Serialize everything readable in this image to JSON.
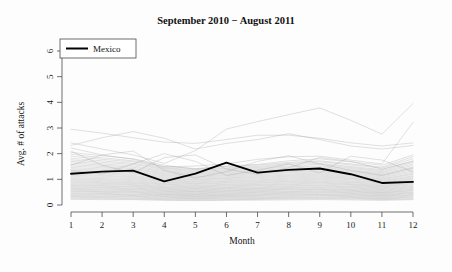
{
  "chart_data": {
    "type": "line",
    "title": "September 2010 − August 2011",
    "xlabel": "Month",
    "ylabel": "Avg. # of attacks",
    "x": [
      1,
      2,
      3,
      4,
      5,
      6,
      7,
      8,
      9,
      10,
      11,
      12
    ],
    "xtick_labels": [
      "1",
      "2",
      "3",
      "4",
      "5",
      "6",
      "7",
      "8",
      "9",
      "10",
      "11",
      "12"
    ],
    "ytick_labels": [
      "0",
      "1",
      "2",
      "3",
      "4",
      "5",
      "6"
    ],
    "yticks": [
      0,
      1,
      2,
      3,
      4,
      5,
      6
    ],
    "xlim": [
      1,
      12
    ],
    "ylim": [
      0,
      6
    ],
    "grid": false,
    "legend_position": "top-left",
    "legend": [
      {
        "name": "Mexico",
        "color": "#000000",
        "style": "solid-bold"
      }
    ],
    "highlight_series": {
      "name": "Mexico",
      "color": "#000000",
      "values": [
        1.22,
        1.3,
        1.34,
        0.92,
        1.22,
        1.65,
        1.26,
        1.37,
        1.42,
        1.2,
        0.86,
        0.9
      ]
    },
    "background_series_color": "#9a9a9a",
    "background_series_count": 48,
    "series": [
      {
        "name": "bg-01",
        "values": [
          2.95,
          2.8,
          2.62,
          2.45,
          2.4,
          2.55,
          2.72,
          2.72,
          2.6,
          2.42,
          2.3,
          2.42
        ]
      },
      {
        "name": "bg-02",
        "values": [
          2.32,
          2.62,
          2.86,
          2.6,
          2.18,
          2.4,
          2.55,
          2.78,
          2.55,
          2.3,
          2.18,
          2.32
        ]
      },
      {
        "name": "bg-03",
        "values": [
          2.42,
          2.18,
          1.95,
          1.62,
          2.12,
          2.96,
          3.25,
          3.52,
          3.78,
          3.3,
          2.76,
          3.95
        ]
      },
      {
        "name": "bg-04",
        "values": [
          2.22,
          1.95,
          1.78,
          1.48,
          1.52,
          1.6,
          1.78,
          1.88,
          1.9,
          1.75,
          1.6,
          3.22
        ]
      },
      {
        "name": "bg-05",
        "values": [
          2.05,
          1.92,
          1.8,
          1.55,
          1.4,
          1.52,
          1.58,
          1.72,
          1.8,
          1.68,
          1.55,
          1.95
        ]
      },
      {
        "name": "bg-06",
        "values": [
          1.98,
          1.84,
          1.72,
          1.5,
          1.42,
          1.5,
          1.55,
          1.66,
          1.72,
          1.6,
          1.48,
          1.88
        ]
      },
      {
        "name": "bg-07",
        "values": [
          1.9,
          1.78,
          1.68,
          1.45,
          1.38,
          1.45,
          1.5,
          1.62,
          1.68,
          1.56,
          1.44,
          1.8
        ]
      },
      {
        "name": "bg-08",
        "values": [
          1.82,
          1.72,
          1.62,
          1.42,
          1.34,
          1.42,
          1.46,
          1.58,
          1.62,
          1.5,
          1.38,
          1.72
        ]
      },
      {
        "name": "bg-09",
        "values": [
          1.76,
          1.66,
          1.58,
          1.38,
          1.3,
          1.38,
          1.42,
          1.52,
          1.58,
          1.46,
          1.34,
          1.66
        ]
      },
      {
        "name": "bg-10",
        "values": [
          1.7,
          1.6,
          1.52,
          1.34,
          1.26,
          1.34,
          1.38,
          1.48,
          1.52,
          1.42,
          1.3,
          1.6
        ]
      },
      {
        "name": "bg-11",
        "values": [
          1.64,
          1.55,
          1.47,
          1.3,
          1.22,
          1.3,
          1.34,
          1.43,
          1.47,
          1.37,
          1.26,
          1.54
        ]
      },
      {
        "name": "bg-12",
        "values": [
          1.58,
          1.5,
          1.42,
          1.26,
          1.19,
          1.26,
          1.3,
          1.39,
          1.42,
          1.33,
          1.22,
          1.48
        ]
      },
      {
        "name": "bg-13",
        "values": [
          1.52,
          1.45,
          1.38,
          1.22,
          1.15,
          1.22,
          1.26,
          1.34,
          1.38,
          1.29,
          1.18,
          1.43
        ]
      },
      {
        "name": "bg-14",
        "values": [
          1.46,
          1.4,
          1.33,
          1.18,
          1.11,
          1.18,
          1.22,
          1.3,
          1.33,
          1.25,
          1.14,
          1.38
        ]
      },
      {
        "name": "bg-15",
        "values": [
          1.41,
          1.35,
          1.29,
          1.14,
          1.08,
          1.14,
          1.18,
          1.26,
          1.29,
          1.21,
          1.1,
          1.33
        ]
      },
      {
        "name": "bg-16",
        "values": [
          1.36,
          1.3,
          1.24,
          1.1,
          1.04,
          1.1,
          1.14,
          1.21,
          1.25,
          1.17,
          1.06,
          1.28
        ]
      },
      {
        "name": "bg-17",
        "values": [
          1.31,
          1.25,
          1.2,
          1.06,
          1.0,
          1.06,
          1.1,
          1.17,
          1.21,
          1.13,
          1.02,
          1.23
        ]
      },
      {
        "name": "bg-18",
        "values": [
          1.26,
          1.21,
          1.15,
          1.02,
          0.97,
          1.03,
          1.06,
          1.13,
          1.17,
          1.09,
          0.99,
          1.19
        ]
      },
      {
        "name": "bg-19",
        "values": [
          1.21,
          1.16,
          1.11,
          0.98,
          0.93,
          0.99,
          1.02,
          1.09,
          1.13,
          1.05,
          0.95,
          1.14
        ]
      },
      {
        "name": "bg-20",
        "values": [
          1.16,
          1.12,
          1.07,
          0.95,
          0.9,
          0.95,
          0.98,
          1.05,
          1.09,
          1.02,
          0.92,
          1.1
        ]
      },
      {
        "name": "bg-21",
        "values": [
          1.12,
          1.07,
          1.03,
          0.91,
          0.86,
          0.92,
          0.94,
          1.01,
          1.05,
          0.98,
          0.88,
          1.06
        ]
      },
      {
        "name": "bg-22",
        "values": [
          1.07,
          1.03,
          0.99,
          0.88,
          0.83,
          0.88,
          0.91,
          0.97,
          1.01,
          0.94,
          0.85,
          1.02
        ]
      },
      {
        "name": "bg-23",
        "values": [
          1.03,
          0.99,
          0.95,
          0.84,
          0.8,
          0.85,
          0.87,
          0.93,
          0.97,
          0.9,
          0.82,
          0.98
        ]
      },
      {
        "name": "bg-24",
        "values": [
          0.99,
          0.95,
          0.91,
          0.81,
          0.76,
          0.81,
          0.84,
          0.9,
          0.93,
          0.87,
          0.78,
          0.94
        ]
      },
      {
        "name": "bg-25",
        "values": [
          0.95,
          0.91,
          0.87,
          0.78,
          0.73,
          0.78,
          0.8,
          0.86,
          0.89,
          0.83,
          0.75,
          0.9
        ]
      },
      {
        "name": "bg-26",
        "values": [
          0.91,
          0.87,
          0.84,
          0.74,
          0.7,
          0.75,
          0.77,
          0.82,
          0.86,
          0.8,
          0.72,
          0.86
        ]
      },
      {
        "name": "bg-27",
        "values": [
          0.87,
          0.84,
          0.8,
          0.71,
          0.67,
          0.71,
          0.74,
          0.79,
          0.82,
          0.77,
          0.69,
          0.83
        ]
      },
      {
        "name": "bg-28",
        "values": [
          0.83,
          0.8,
          0.77,
          0.68,
          0.64,
          0.68,
          0.7,
          0.75,
          0.78,
          0.73,
          0.66,
          0.79
        ]
      },
      {
        "name": "bg-29",
        "values": [
          0.79,
          0.76,
          0.73,
          0.65,
          0.61,
          0.65,
          0.67,
          0.72,
          0.75,
          0.7,
          0.63,
          0.75
        ]
      },
      {
        "name": "bg-30",
        "values": [
          0.76,
          0.73,
          0.7,
          0.62,
          0.58,
          0.62,
          0.64,
          0.68,
          0.71,
          0.67,
          0.6,
          0.72
        ]
      },
      {
        "name": "bg-31",
        "values": [
          0.72,
          0.69,
          0.66,
          0.59,
          0.55,
          0.59,
          0.61,
          0.65,
          0.68,
          0.63,
          0.57,
          0.68
        ]
      },
      {
        "name": "bg-32",
        "values": [
          0.68,
          0.66,
          0.63,
          0.56,
          0.52,
          0.56,
          0.58,
          0.62,
          0.64,
          0.6,
          0.54,
          0.65
        ]
      },
      {
        "name": "bg-33",
        "values": [
          0.65,
          0.62,
          0.6,
          0.53,
          0.5,
          0.53,
          0.55,
          0.59,
          0.61,
          0.57,
          0.51,
          0.61
        ]
      },
      {
        "name": "bg-34",
        "values": [
          0.61,
          0.59,
          0.56,
          0.5,
          0.47,
          0.5,
          0.52,
          0.55,
          0.58,
          0.54,
          0.48,
          0.58
        ]
      },
      {
        "name": "bg-35",
        "values": [
          0.58,
          0.55,
          0.53,
          0.47,
          0.44,
          0.47,
          0.49,
          0.52,
          0.54,
          0.51,
          0.46,
          0.55
        ]
      },
      {
        "name": "bg-36",
        "values": [
          0.54,
          0.52,
          0.5,
          0.44,
          0.41,
          0.44,
          0.46,
          0.49,
          0.51,
          0.48,
          0.43,
          0.51
        ]
      },
      {
        "name": "bg-37",
        "values": [
          0.51,
          0.49,
          0.47,
          0.41,
          0.39,
          0.41,
          0.43,
          0.46,
          0.48,
          0.45,
          0.4,
          0.48
        ]
      },
      {
        "name": "bg-38",
        "values": [
          0.47,
          0.45,
          0.43,
          0.39,
          0.36,
          0.38,
          0.4,
          0.43,
          0.44,
          0.42,
          0.37,
          0.45
        ]
      },
      {
        "name": "bg-39",
        "values": [
          0.44,
          0.42,
          0.4,
          0.36,
          0.33,
          0.36,
          0.37,
          0.4,
          0.41,
          0.39,
          0.35,
          0.41
        ]
      },
      {
        "name": "bg-40",
        "values": [
          0.4,
          0.39,
          0.37,
          0.33,
          0.31,
          0.33,
          0.34,
          0.37,
          0.38,
          0.36,
          0.32,
          0.38
        ]
      },
      {
        "name": "bg-41",
        "values": [
          0.37,
          0.35,
          0.34,
          0.3,
          0.28,
          0.3,
          0.31,
          0.33,
          0.35,
          0.33,
          0.29,
          0.35
        ]
      },
      {
        "name": "bg-42",
        "values": [
          0.33,
          0.32,
          0.31,
          0.27,
          0.25,
          0.27,
          0.28,
          0.3,
          0.31,
          0.3,
          0.26,
          0.31
        ]
      },
      {
        "name": "bg-43",
        "values": [
          0.3,
          0.29,
          0.27,
          0.24,
          0.23,
          0.24,
          0.25,
          0.27,
          0.28,
          0.27,
          0.24,
          0.28
        ]
      },
      {
        "name": "bg-44",
        "values": [
          0.26,
          0.25,
          0.24,
          0.21,
          0.2,
          0.21,
          0.22,
          0.24,
          0.25,
          0.24,
          0.21,
          0.24
        ]
      },
      {
        "name": "bg-45",
        "values": [
          0.22,
          0.21,
          0.21,
          0.18,
          0.17,
          0.18,
          0.19,
          0.2,
          0.21,
          0.2,
          0.18,
          0.21
        ]
      },
      {
        "name": "bg-46",
        "values": [
          1.55,
          1.95,
          2.1,
          1.35,
          1.05,
          1.3,
          1.7,
          1.92,
          1.6,
          1.35,
          1.15,
          1.45
        ]
      },
      {
        "name": "bg-47",
        "values": [
          2.1,
          1.55,
          1.25,
          1.85,
          1.95,
          1.4,
          1.2,
          1.45,
          1.85,
          1.7,
          1.4,
          1.7
        ]
      },
      {
        "name": "bg-48",
        "values": [
          1.35,
          1.2,
          1.6,
          2.0,
          1.7,
          1.15,
          1.35,
          1.6,
          1.25,
          1.9,
          1.75,
          1.3
        ]
      }
    ]
  }
}
